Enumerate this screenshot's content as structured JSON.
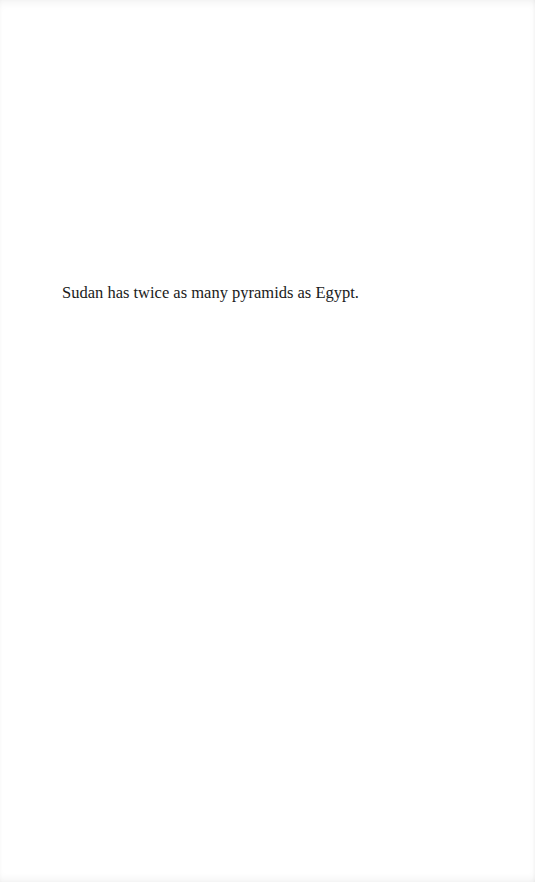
{
  "page": {
    "paragraphs": [
      "Sudan has twice as many pyramids as Egypt."
    ]
  },
  "colors": {
    "background": "#ffffff",
    "text": "#1a1a1a"
  }
}
